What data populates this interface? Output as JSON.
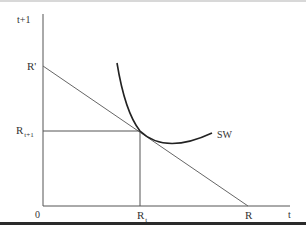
{
  "diagram": {
    "type": "intertemporal-choice",
    "axes": {
      "y_label": "t+1",
      "x_label": "t",
      "origin_label": "0"
    },
    "labels": {
      "r_prime": "R'",
      "r_t1_main": "R",
      "r_t1_sub": "t+1",
      "r_t_main": "R",
      "r_t_sub": "t",
      "r": "R",
      "curve": "SW"
    },
    "colors": {
      "axis": "#555555",
      "budget_line": "#555555",
      "curve": "#222222",
      "guide": "#555555"
    },
    "elements": [
      {
        "name": "budget-line",
        "from": "R'",
        "to": "R"
      },
      {
        "name": "indifference-curve",
        "label": "SW",
        "tangent_point": [
          "R_t",
          "R_t+1"
        ]
      },
      {
        "name": "guide-horizontal",
        "at": "R_t+1"
      },
      {
        "name": "guide-vertical",
        "at": "R_t"
      }
    ]
  }
}
